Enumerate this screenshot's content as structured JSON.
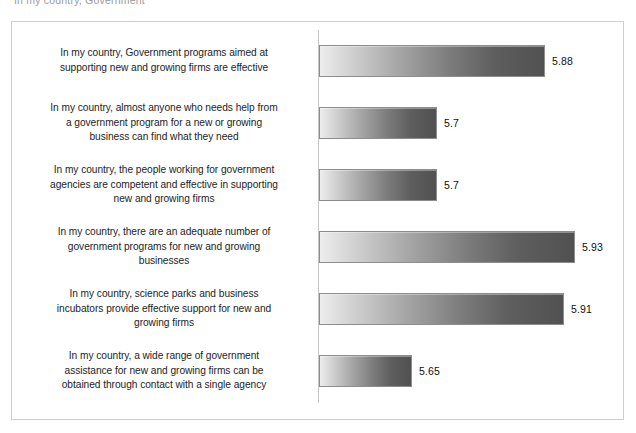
{
  "clipped_header_text": "In my country, Government",
  "chart_data": {
    "type": "bar",
    "orientation": "horizontal",
    "title": "",
    "subtitle": "",
    "xlabel": "",
    "ylabel": "",
    "grid": false,
    "legend": false,
    "axis_line": "vertical category axis at left of plot",
    "value_label_format": "trailing-zero trimmed",
    "categories": [
      "In my country, Government programs aimed at supporting new and growing firms are effective",
      "In my country, almost anyone who needs help from a government program for a new or growing business can find what they need",
      "In my country, the people working for government agencies are competent and effective in supporting new and growing firms",
      "In my country, there are an adequate number of government programs for new and growing businesses",
      "In my country, science parks and business incubators provide effective support for new and growing firms",
      "In my country, a wide range of government assistance for new and growing firms can be obtained through contact with a single agency"
    ],
    "values": [
      5.88,
      5.7,
      5.7,
      5.93,
      5.91,
      5.65
    ],
    "value_labels": [
      "5.88",
      "5.7",
      "5.7",
      "5.93",
      "5.91",
      "5.65"
    ],
    "xlim": [
      5.6,
      5.96
    ]
  },
  "rows": [
    {
      "label_lines": [
        "In my country, Government programs aimed at",
        "supporting new and growing firms are effective"
      ],
      "value_label": "5.88",
      "bar_px": 226
    },
    {
      "label_lines": [
        "In my country, almost anyone who needs help from",
        "a government program for a new or growing",
        "business can find what they need"
      ],
      "value_label": "5.7",
      "bar_px": 118
    },
    {
      "label_lines": [
        "In my country, the people working for government",
        "agencies are competent and effective in supporting",
        "new and growing firms"
      ],
      "value_label": "5.7",
      "bar_px": 118
    },
    {
      "label_lines": [
        "In my country, there are an adequate number of",
        "government programs for new and growing",
        "businesses"
      ],
      "value_label": "5.93",
      "bar_px": 256
    },
    {
      "label_lines": [
        "In my country, science parks and business",
        "incubators provide effective support for new and",
        "growing firms"
      ],
      "value_label": "5.91",
      "bar_px": 245
    },
    {
      "label_lines": [
        "In my country, a wide range of government",
        "assistance for new and growing firms can be",
        "obtained through contact with a single agency"
      ],
      "value_label": "5.65",
      "bar_px": 93
    }
  ]
}
